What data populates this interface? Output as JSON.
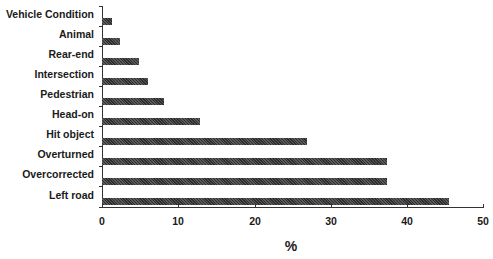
{
  "chart_data": {
    "type": "bar",
    "orientation": "horizontal",
    "title": "",
    "xlabel": "%",
    "ylabel": "",
    "xlim": [
      0,
      50
    ],
    "xticks": [
      0,
      10,
      20,
      30,
      40,
      50
    ],
    "grid": false,
    "legend": null,
    "categories": [
      "Vehicle Condition",
      "Animal",
      "Rear-end",
      "Intersection",
      "Pedestrian",
      "Head-on",
      "Hit object",
      "Overturned",
      "Overcorrected",
      "Left road"
    ],
    "values": [
      1.3,
      2.4,
      4.9,
      6.0,
      8.2,
      12.9,
      26.9,
      37.4,
      37.4,
      45.5
    ],
    "bar_fill": "crosshatch dark gray"
  },
  "labels": {
    "categories": [
      "Vehicle Condition",
      "Animal",
      "Rear-end",
      "Intersection",
      "Pedestrian",
      "Head-on",
      "Hit object",
      "Overturned",
      "Overcorrected",
      "Left road"
    ],
    "xticks": [
      "0",
      "10",
      "20",
      "30",
      "40",
      "50"
    ],
    "xlabel": "%"
  }
}
